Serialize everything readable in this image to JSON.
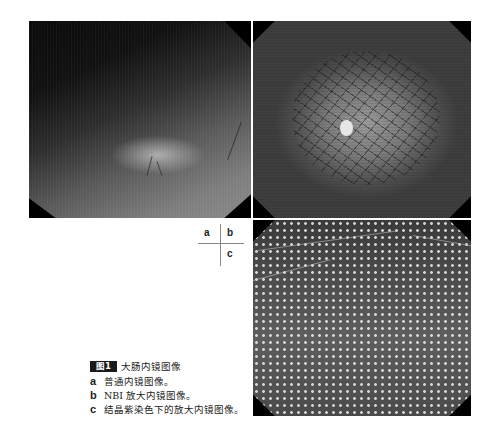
{
  "figure": {
    "panels": [
      {
        "id": "a",
        "description": "普通内镜图像 (white-light endoscopy)"
      },
      {
        "id": "b",
        "description": "NBI 放大内镜图像 (magnified NBI)"
      },
      {
        "id": "c",
        "description": "结晶紫染色下的放大内镜图像 (crystal violet magnified)"
      }
    ],
    "layout_key": {
      "a": "a",
      "b": "b",
      "c": "c"
    },
    "caption": {
      "badge": "图1",
      "title": "大肠内镜图像",
      "items": [
        {
          "letter": "a",
          "text": "普通内镜图像。"
        },
        {
          "letter": "b",
          "text": "NBI 放大内镜图像。"
        },
        {
          "letter": "c",
          "text": "结晶紫染色下的放大内镜图像。"
        }
      ]
    }
  }
}
